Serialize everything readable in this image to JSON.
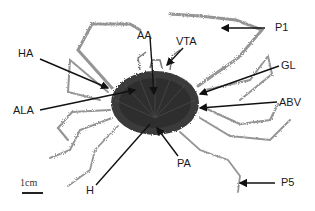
{
  "figure": {
    "labels": {
      "P1": "P1",
      "HA": "HA",
      "AA": "AA",
      "VTA": "VTA",
      "GL": "GL",
      "ALA": "ALA",
      "ABV": "ABV",
      "H": "H",
      "PA": "PA",
      "P5": "P5"
    },
    "scale_bar": {
      "text": "1cm"
    },
    "colors": {
      "specimen_body": "#3a3a3a",
      "legs": "#8a8a8a",
      "arrows": "#111111",
      "background": "#ffffff"
    }
  }
}
